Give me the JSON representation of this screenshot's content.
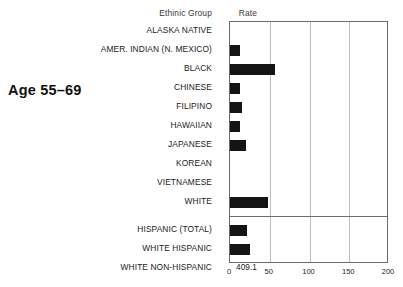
{
  "side_title": "Age 55–69",
  "headers": {
    "group": "Ethinic Group",
    "rate": "Rate"
  },
  "star_symbol": "∗",
  "chart_data": {
    "type": "bar",
    "orientation": "horizontal",
    "title": "Age 55–69",
    "xlabel": "",
    "ylabel": "Ethinic Group",
    "xlim": [
      0,
      200
    ],
    "xticks": [
      0,
      50,
      100,
      150,
      200
    ],
    "xtick_labels": [
      "0",
      "50",
      "100",
      "150",
      "200"
    ],
    "grid": true,
    "grid_axis": "x",
    "legend": false,
    "bar_color": "#141414",
    "rate_column_header": "Rate",
    "note": "Rate column shows published rate values; bar lengths are plotted on the 0–200 axis. Asterisk denotes value not shown / suppressed.",
    "categories": [
      "ALASKA NATIVE",
      "AMER. INDIAN (N. MEXICO)",
      "BLACK",
      "CHINESE",
      "FILIPINO",
      "HAWAIIAN",
      "JAPANESE",
      "KOREAN",
      "VIETNAMESE",
      "WHITE",
      "HISPANIC (TOTAL)",
      "WHITE HISPANIC",
      "WHITE NON-HISPANIC"
    ],
    "rates": [
      null,
      131.7,
      576.4,
      105.7,
      151.7,
      143.1,
      203.1,
      null,
      null,
      1395.8,
      242.8,
      251.2,
      409.1
    ],
    "rate_labels": [
      "∗",
      "131.7",
      "576.4",
      "105.7",
      "151.7",
      "143.1",
      "203.1",
      "∗",
      "∗",
      "1395.8",
      "242.8",
      "251.2",
      "409.1"
    ],
    "values": [
      null,
      13,
      56,
      12,
      15,
      13,
      20,
      null,
      null,
      48,
      22,
      25,
      41
    ],
    "groups": [
      {
        "name": "ethnic",
        "rows": [
          {
            "label": "ALASKA NATIVE",
            "rate_label": "∗",
            "rate": null,
            "value": null,
            "suppressed": true
          },
          {
            "label": "AMER. INDIAN (N. MEXICO)",
            "rate_label": "131.7",
            "rate": 131.7,
            "value": 13,
            "suppressed": false
          },
          {
            "label": "BLACK",
            "rate_label": "576.4",
            "rate": 576.4,
            "value": 56,
            "suppressed": false
          },
          {
            "label": "CHINESE",
            "rate_label": "105.7",
            "rate": 105.7,
            "value": 12,
            "suppressed": false
          },
          {
            "label": "FILIPINO",
            "rate_label": "151.7",
            "rate": 151.7,
            "value": 15,
            "suppressed": false
          },
          {
            "label": "HAWAIIAN",
            "rate_label": "143.1",
            "rate": 143.1,
            "value": 13,
            "suppressed": false
          },
          {
            "label": "JAPANESE",
            "rate_label": "203.1",
            "rate": 203.1,
            "value": 20,
            "suppressed": false
          },
          {
            "label": "KOREAN",
            "rate_label": "∗",
            "rate": null,
            "value": null,
            "suppressed": true
          },
          {
            "label": "VIETNAMESE",
            "rate_label": "∗",
            "rate": null,
            "value": null,
            "suppressed": true
          },
          {
            "label": "WHITE",
            "rate_label": "1395.8",
            "rate": 1395.8,
            "value": 48,
            "suppressed": false
          }
        ]
      },
      {
        "name": "hispanic",
        "rows": [
          {
            "label": "HISPANIC (TOTAL)",
            "rate_label": "242.8",
            "rate": 242.8,
            "value": 22,
            "suppressed": false
          },
          {
            "label": "WHITE HISPANIC",
            "rate_label": "251.2",
            "rate": 251.2,
            "value": 25,
            "suppressed": false
          },
          {
            "label": "WHITE NON-HISPANIC",
            "rate_label": "409.1",
            "rate": 409.1,
            "value": 41,
            "suppressed": false
          }
        ]
      }
    ]
  }
}
